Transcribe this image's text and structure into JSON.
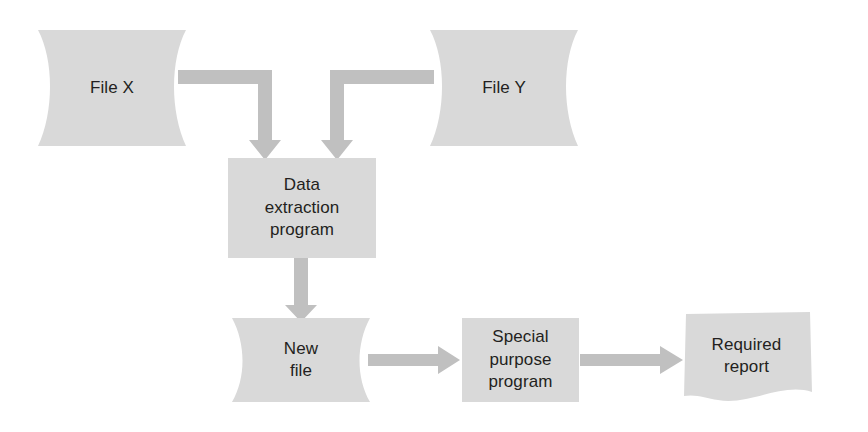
{
  "diagram": {
    "colors": {
      "shape_fill": "#d9d9d9",
      "arrow": "#c0c0c0",
      "text": "#231f20",
      "background": "#ffffff"
    },
    "nodes": [
      {
        "id": "file-x",
        "label": "File X",
        "shape": "magnetic-file",
        "x": 38,
        "y": 30,
        "w": 148,
        "h": 116
      },
      {
        "id": "file-y",
        "label": "File Y",
        "shape": "magnetic-file",
        "x": 430,
        "y": 30,
        "w": 148,
        "h": 116
      },
      {
        "id": "extract",
        "label": "Data\nextraction\nprogram",
        "shape": "process-box",
        "x": 228,
        "y": 158,
        "w": 148,
        "h": 100
      },
      {
        "id": "newfile",
        "label": "New\nfile",
        "shape": "magnetic-file",
        "x": 232,
        "y": 318,
        "w": 138,
        "h": 84
      },
      {
        "id": "special",
        "label": "Special\npurpose\nprogram",
        "shape": "process-box",
        "x": 462,
        "y": 318,
        "w": 117,
        "h": 84
      },
      {
        "id": "report",
        "label": "Required\nreport",
        "shape": "document",
        "x": 684,
        "y": 314,
        "w": 125,
        "h": 84
      }
    ],
    "connectors": [
      {
        "id": "filex-to-extract",
        "from": "file-x",
        "to": "extract",
        "style": "elbow-right-down"
      },
      {
        "id": "filey-to-extract",
        "from": "file-y",
        "to": "extract",
        "style": "elbow-left-down"
      },
      {
        "id": "extract-to-newfile",
        "from": "extract",
        "to": "newfile",
        "style": "straight-down"
      },
      {
        "id": "newfile-to-special",
        "from": "newfile",
        "to": "special",
        "style": "straight-right"
      },
      {
        "id": "special-to-report",
        "from": "special",
        "to": "report",
        "style": "straight-right"
      }
    ]
  }
}
